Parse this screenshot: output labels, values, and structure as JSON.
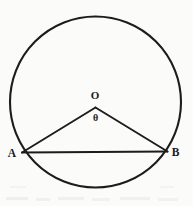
{
  "figure": {
    "background_color": "#fbfbfa",
    "ink_color": "#1c1c1c",
    "labels": {
      "center_label": "O",
      "angle_label": "θ",
      "left_vertex_label": "A",
      "right_vertex_label": "B"
    },
    "geometry": {
      "circle": {
        "cx": 95.5,
        "cy": 102,
        "r": 85.5,
        "stroke_width": 2.1
      },
      "vertex_o": {
        "x": 95.5,
        "y": 107.5
      },
      "vertex_a": {
        "x": 22.0,
        "y": 152.5
      },
      "vertex_b": {
        "x": 167.5,
        "y": 151.5
      },
      "segments": [
        {
          "name": "radius-OA",
          "from": "O",
          "to": "A"
        },
        {
          "name": "radius-OB",
          "from": "O",
          "to": "B"
        },
        {
          "name": "chord-AB",
          "from": "A",
          "to": "B"
        }
      ]
    },
    "label_positions": {
      "center_label": {
        "x": 95.0,
        "y": 98.5
      },
      "angle_label": {
        "x": 95.5,
        "y": 121.0
      },
      "left_vertex_label": {
        "x": 12.0,
        "y": 157.0
      },
      "right_vertex_label": {
        "x": 175.5,
        "y": 155.5
      }
    }
  }
}
